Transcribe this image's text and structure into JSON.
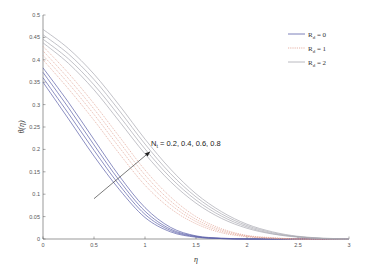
{
  "chart_data": {
    "type": "line",
    "title": "",
    "xlabel": "η",
    "ylabel": "θ(η)",
    "xlim": [
      0,
      3
    ],
    "ylim": [
      0,
      0.5
    ],
    "xticks": [
      0,
      0.5,
      1,
      1.5,
      2,
      2.5,
      3
    ],
    "xtick_labels": [
      "0",
      "0.5",
      "1",
      "1.5",
      "2",
      "2.5",
      "3"
    ],
    "yticks": [
      0,
      0.05,
      0.1,
      0.15,
      0.2,
      0.25,
      0.3,
      0.35,
      0.4,
      0.45,
      0.5
    ],
    "ytick_labels": [
      "0",
      "0.05",
      "0.1",
      "0.15",
      "0.2",
      "0.25",
      "0.3",
      "0.35",
      "0.4",
      "0.45",
      "0.5"
    ],
    "grid": false,
    "legend_position": "upper right",
    "x": [
      0,
      0.25,
      0.5,
      0.75,
      1,
      1.25,
      1.5,
      1.75,
      2,
      2.25,
      2.5,
      2.75,
      3
    ],
    "series": [
      {
        "name": "R_d = 0, N_t = 0.2",
        "group": "Rd0",
        "values": [
          0.35,
          0.268,
          0.185,
          0.11,
          0.048,
          0.016,
          0.004,
          0.001,
          0,
          0,
          0,
          0,
          0
        ]
      },
      {
        "name": "R_d = 0, N_t = 0.4",
        "group": "Rd0",
        "values": [
          0.36,
          0.28,
          0.198,
          0.12,
          0.055,
          0.019,
          0.005,
          0.001,
          0,
          0,
          0,
          0,
          0
        ]
      },
      {
        "name": "R_d = 0, N_t = 0.6",
        "group": "Rd0",
        "values": [
          0.372,
          0.293,
          0.21,
          0.13,
          0.062,
          0.022,
          0.006,
          0.001,
          0,
          0,
          0,
          0,
          0
        ]
      },
      {
        "name": "R_d = 0, N_t = 0.8",
        "group": "Rd0",
        "values": [
          0.382,
          0.305,
          0.222,
          0.14,
          0.07,
          0.026,
          0.007,
          0.002,
          0,
          0,
          0,
          0,
          0
        ]
      },
      {
        "name": "R_d = 1, N_t = 0.2",
        "group": "Rd1",
        "values": [
          0.4,
          0.335,
          0.265,
          0.19,
          0.12,
          0.068,
          0.034,
          0.014,
          0.005,
          0.001,
          0,
          0,
          0
        ]
      },
      {
        "name": "R_d = 1, N_t = 0.4",
        "group": "Rd1",
        "values": [
          0.41,
          0.347,
          0.278,
          0.204,
          0.132,
          0.077,
          0.039,
          0.017,
          0.006,
          0.002,
          0,
          0,
          0
        ]
      },
      {
        "name": "R_d = 1, N_t = 0.6",
        "group": "Rd1",
        "values": [
          0.42,
          0.358,
          0.29,
          0.216,
          0.143,
          0.085,
          0.044,
          0.02,
          0.007,
          0.002,
          0,
          0,
          0
        ]
      },
      {
        "name": "R_d = 1, N_t = 0.8",
        "group": "Rd1",
        "values": [
          0.43,
          0.37,
          0.302,
          0.228,
          0.154,
          0.094,
          0.05,
          0.023,
          0.008,
          0.003,
          0,
          0,
          0
        ]
      },
      {
        "name": "R_d = 2, N_t = 0.2",
        "group": "Rd2",
        "values": [
          0.438,
          0.392,
          0.333,
          0.262,
          0.19,
          0.128,
          0.08,
          0.046,
          0.024,
          0.011,
          0.004,
          0.001,
          0
        ]
      },
      {
        "name": "R_d = 2, N_t = 0.4",
        "group": "Rd2",
        "values": [
          0.446,
          0.402,
          0.344,
          0.274,
          0.201,
          0.137,
          0.087,
          0.051,
          0.027,
          0.012,
          0.005,
          0.001,
          0
        ]
      },
      {
        "name": "R_d = 2, N_t = 0.6",
        "group": "Rd2",
        "values": [
          0.456,
          0.413,
          0.356,
          0.286,
          0.212,
          0.146,
          0.094,
          0.056,
          0.03,
          0.014,
          0.005,
          0.001,
          0
        ]
      },
      {
        "name": "R_d = 2, N_t = 0.8",
        "group": "Rd2",
        "values": [
          0.468,
          0.425,
          0.368,
          0.298,
          0.223,
          0.156,
          0.101,
          0.061,
          0.033,
          0.016,
          0.006,
          0.002,
          0
        ]
      }
    ],
    "legend": [
      {
        "label_main": "R",
        "label_sub": "d",
        "label_rest": " = 0",
        "group": "Rd0",
        "color": "#5a5fa8",
        "dash": ""
      },
      {
        "label_main": "R",
        "label_sub": "d",
        "label_rest": " = 1",
        "group": "Rd1",
        "color": "#e0a090",
        "dash": "1.2,1"
      },
      {
        "label_main": "R",
        "label_sub": "d",
        "label_rest": " = 2",
        "group": "Rd2",
        "color": "#a8a8b0",
        "dash": ""
      }
    ],
    "annotations": [
      {
        "text_main": "N",
        "text_sub": "t",
        "text_rest": " = 0.2, 0.4, 0.6, 0.8",
        "arrow_from": [
          0.5,
          0.09
        ],
        "arrow_to": [
          1.05,
          0.195
        ],
        "text_at": [
          1.05,
          0.2
        ]
      }
    ]
  }
}
